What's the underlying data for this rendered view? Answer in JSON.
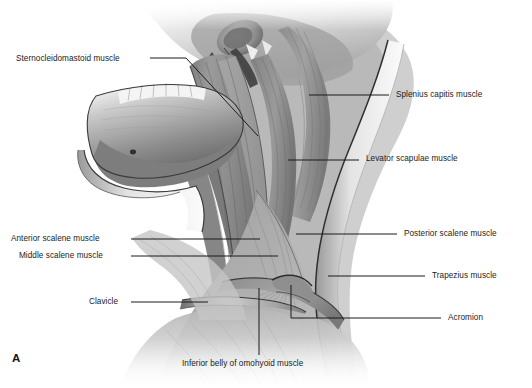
{
  "figure": {
    "panel_letter": "A",
    "region": "lateral neck",
    "style": "grayscale anatomical illustration",
    "background_color": "#ffffff",
    "leader_color": "#1b1b1b",
    "text_color": "#1b1b1b"
  },
  "labels": [
    {
      "id": "sternocleidomastoid",
      "text": "Sternocleidomastoid muscle",
      "side": "left",
      "text_x": 16,
      "text_y": 54,
      "leader": "M150,58 L186,58 L258,136"
    },
    {
      "id": "splenius-capitis",
      "text": "Splenius capitis muscle",
      "side": "right",
      "text_x": 396,
      "text_y": 94,
      "leader": "M309,95 L389,95"
    },
    {
      "id": "levator-scapulae",
      "text": "Levator scapulae muscle",
      "side": "right",
      "text_x": 366,
      "text_y": 158,
      "leader": "M288,160 L359,160"
    },
    {
      "id": "posterior-scalene",
      "text": "Posterior scalene muscle",
      "side": "right",
      "text_x": 404,
      "text_y": 228,
      "leader": "M296,234 L397,234"
    },
    {
      "id": "anterior-scalene",
      "text": "Anterior scalene muscle",
      "side": "left",
      "text_x": 11,
      "text_y": 235,
      "leader": "M131,239 L260,239"
    },
    {
      "id": "middle-scalene",
      "text": "Middle scalene muscle",
      "side": "left",
      "text_x": 19,
      "text_y": 252,
      "leader": "M131,256 L278,256"
    },
    {
      "id": "trapezius",
      "text": "Trapezius muscle",
      "side": "right",
      "text_x": 432,
      "text_y": 271,
      "leader": "M328,276 L425,276"
    },
    {
      "id": "clavicle",
      "text": "Clavicle",
      "side": "left",
      "text_x": 89,
      "text_y": 297,
      "leader": "M131,302 L208,302"
    },
    {
      "id": "acromion",
      "text": "Acromion",
      "side": "right",
      "text_x": 448,
      "text_y": 313,
      "leader": "M291,285 L291,318 L441,318"
    },
    {
      "id": "inferior-belly-omohyoid",
      "text": "Inferior belly of omohyoid muscle",
      "side": "bottom",
      "text_x": 182,
      "text_y": 363,
      "leader": "M259,288 L259,355"
    }
  ]
}
